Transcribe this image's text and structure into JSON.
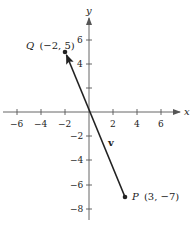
{
  "diagram": {
    "type": "vector-on-coordinate-plane",
    "axes": {
      "x_label": "x",
      "y_label": "y",
      "x_ticks": [
        "−6",
        "−4",
        "−2",
        "2",
        "4",
        "6"
      ],
      "y_ticks": [
        "6",
        "4",
        "−2",
        "−4",
        "−6",
        "−8"
      ]
    },
    "points": {
      "Q": {
        "letter": "Q",
        "coords": "(−2, 5)",
        "x": -2,
        "y": 5
      },
      "P": {
        "letter": "P",
        "coords": "(3, −7)",
        "x": 3,
        "y": -7
      }
    },
    "vector": {
      "label": "v",
      "from": "P",
      "to": "Q"
    },
    "colors": {
      "ink": "#222222",
      "background": "#ffffff"
    }
  }
}
